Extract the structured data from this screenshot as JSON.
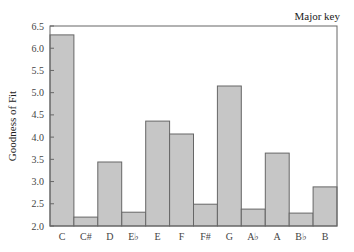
{
  "chart_data": {
    "type": "bar",
    "title": "Major key",
    "xlabel": "",
    "ylabel": "Goodness of Fit",
    "categories": [
      "C",
      "C#",
      "D",
      "E♭",
      "E",
      "F",
      "F#",
      "G",
      "A♭",
      "A",
      "B♭",
      "B"
    ],
    "values": [
      6.3,
      2.2,
      3.44,
      2.31,
      4.36,
      4.07,
      2.49,
      5.15,
      2.38,
      3.64,
      2.29,
      2.88
    ],
    "ylim": [
      2.0,
      6.5
    ],
    "yticks": [
      "2.0",
      "2.5",
      "3.0",
      "3.5",
      "4.0",
      "4.5",
      "5.0",
      "5.5",
      "6.0",
      "6.5"
    ],
    "grid": false,
    "legend": null,
    "bar_color": "#c6c6c6",
    "edge_color": "#666666"
  }
}
